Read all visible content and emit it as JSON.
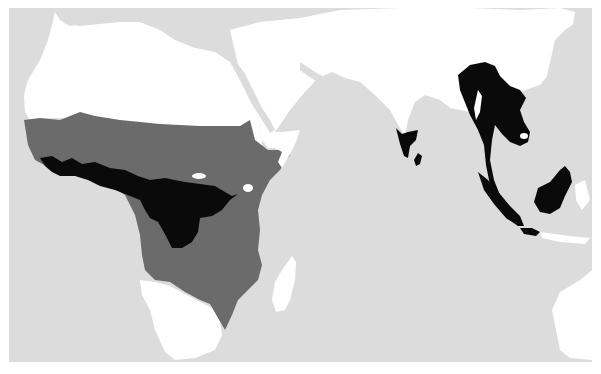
{
  "map": {
    "type": "species-distribution",
    "colors": {
      "ocean": "#dcdcdc",
      "land": "#ffffff",
      "range_primary": "#0a0a0a",
      "range_secondary": "#6b6b6b",
      "background": "#ffffff"
    },
    "legend": [],
    "regions": [
      {
        "name": "Africa sub-Saharan band",
        "fill": "range_secondary"
      },
      {
        "name": "Central & West African forest",
        "fill": "range_primary"
      },
      {
        "name": "Southern India & Sri Lanka",
        "fill": "range_primary"
      },
      {
        "name": "Indochina",
        "fill": "range_primary"
      },
      {
        "name": "Malay Peninsula",
        "fill": "range_primary"
      },
      {
        "name": "Sumatra",
        "fill": "range_primary"
      },
      {
        "name": "Java",
        "fill": "range_primary"
      },
      {
        "name": "Borneo",
        "fill": "range_primary"
      }
    ]
  }
}
